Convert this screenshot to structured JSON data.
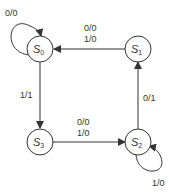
{
  "diagram": {
    "type": "state-machine",
    "states": [
      {
        "id": "S0",
        "letter": "S",
        "sub": "0"
      },
      {
        "id": "S1",
        "letter": "S",
        "sub": "1"
      },
      {
        "id": "S2",
        "letter": "S",
        "sub": "2"
      },
      {
        "id": "S3",
        "letter": "S",
        "sub": "3"
      }
    ],
    "transitions": {
      "s0_self": "0/0",
      "s0_to_s3": "1/1",
      "s1_to_s0_a": "0/0",
      "s1_to_s0_b": "1/0",
      "s3_to_s2_a": "0/0",
      "s3_to_s2_b": "1/0",
      "s2_to_s1": "0/1",
      "s2_self": "1/0"
    },
    "colors": {
      "stroke": "#333333",
      "background": "#ffffff"
    }
  }
}
